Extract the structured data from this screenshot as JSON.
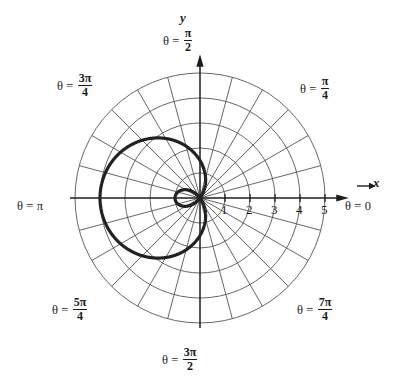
{
  "figure": {
    "kind": "polar-plot",
    "background": "#ffffff",
    "ink_color": "#1c1c1c",
    "grid_color": "#555555",
    "curve_color": "#222222"
  },
  "axes": {
    "x_axis_label": "x",
    "y_axis_label": "y",
    "center_px": [
      200,
      198
    ],
    "unit_px": 25,
    "radial_ticks": [
      "1",
      "2",
      "3",
      "4",
      "5"
    ],
    "radial_tick_values": [
      1,
      2,
      3,
      4,
      5
    ],
    "angle_spokes_deg": [
      0,
      15,
      30,
      45,
      60,
      75,
      90,
      105,
      120,
      135,
      150,
      165,
      180,
      195,
      210,
      225,
      240,
      255,
      270,
      285,
      300,
      315,
      330,
      345
    ]
  },
  "angle_labels": [
    {
      "name": "theta-zero",
      "theta": "θ = ",
      "num": "",
      "den": "",
      "plain": "0",
      "deg": 0
    },
    {
      "name": "theta-pi-over-4",
      "theta": "θ = ",
      "num": "π",
      "den": "4",
      "plain": "",
      "deg": 45
    },
    {
      "name": "theta-pi-over-2",
      "theta": "θ = ",
      "num": "π",
      "den": "2",
      "plain": "",
      "deg": 90
    },
    {
      "name": "theta-3pi-over-4",
      "theta": "θ = ",
      "num": "3π",
      "den": "4",
      "plain": "",
      "deg": 135
    },
    {
      "name": "theta-pi",
      "theta": "θ = ",
      "num": "",
      "den": "",
      "plain": "π",
      "deg": 180
    },
    {
      "name": "theta-5pi-over-4",
      "theta": "θ = ",
      "num": "5π",
      "den": "4",
      "plain": "",
      "deg": 225
    },
    {
      "name": "theta-3pi-over-2",
      "theta": "θ = ",
      "num": "3π",
      "den": "2",
      "plain": "",
      "deg": 270
    },
    {
      "name": "theta-7pi-over-4",
      "theta": "θ = ",
      "num": "7π",
      "den": "4",
      "plain": "",
      "deg": 315
    }
  ],
  "chart_data": {
    "type": "line",
    "coordinate_system": "polar",
    "title": "",
    "xlabel": "x",
    "ylabel": "y",
    "grid": true,
    "legend": null,
    "rlim": [
      0,
      5
    ],
    "r_ticks": [
      1,
      2,
      3,
      4,
      5
    ],
    "theta_tick_labels": [
      "θ = 0",
      "θ = π/4",
      "θ = π/2",
      "θ = 3π/4",
      "θ = π",
      "θ = 5π/4",
      "θ = 3π/2",
      "θ = 7π/4"
    ],
    "series": [
      {
        "name": "limacon-with-inner-loop",
        "equation": "r = 1.5 - 2.5 cos(θ)",
        "a": 1.5,
        "b": 2.5,
        "r_max": 4,
        "inner_loop_extent": 1,
        "sample_points_theta_deg": [
          0,
          30,
          60,
          90,
          120,
          150,
          180,
          210,
          240,
          270,
          300,
          330,
          360
        ],
        "sample_points_r": [
          -1,
          -0.67,
          0.25,
          1.5,
          2.75,
          3.67,
          4,
          3.67,
          2.75,
          1.5,
          0.25,
          -0.67,
          -1
        ]
      }
    ]
  }
}
